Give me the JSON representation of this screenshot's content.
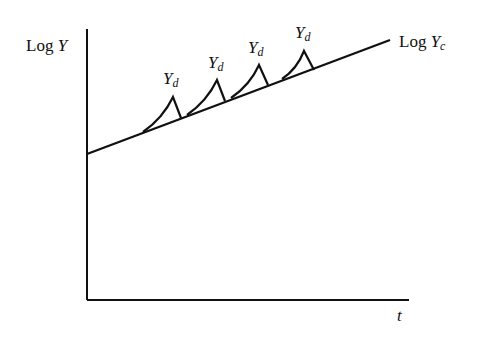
{
  "diagram": {
    "y_axis_label": {
      "prefix": "Log ",
      "var": "Y"
    },
    "x_axis_label": "t",
    "trend_label": {
      "prefix": "Log ",
      "var": "Y",
      "sub": "c"
    },
    "bump_labels": [
      {
        "var": "Y",
        "sub": "d"
      },
      {
        "var": "Y",
        "sub": "d"
      },
      {
        "var": "Y",
        "sub": "d"
      },
      {
        "var": "Y",
        "sub": "d"
      }
    ],
    "colors": {
      "line": "#111111",
      "background": "#ffffff"
    }
  }
}
